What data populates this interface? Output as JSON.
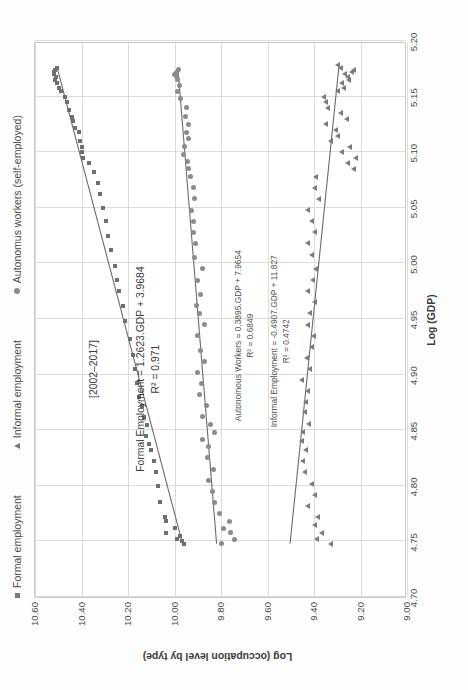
{
  "legend": {
    "items": [
      {
        "label": "Formal employment",
        "marker": "square-marker-icon",
        "color": "#7a7a7a"
      },
      {
        "label": "Informal employment",
        "marker": "triangle-marker-icon",
        "color": "#7a7a7a"
      },
      {
        "label": "Autonomus workers (self-employed)",
        "marker": "circle-marker-icon",
        "color": "#8a8a8a"
      }
    ]
  },
  "period_note": "[2002–2017]",
  "annotations": [
    {
      "equation": "Formal Employment = 1.2623.GDP + 3.9684",
      "r2": "R² = 0.971"
    },
    {
      "equation": "Autonomous Workers = 0.3895.GDP + 7.9654",
      "r2": "R² = 0.6849"
    },
    {
      "equation": "Informal Employment = -0.4907.GDP + 11.827",
      "r2": "R² = 0.4742"
    }
  ],
  "chart_data": {
    "type": "scatter",
    "title": "",
    "xlabel": "Log (GDP)",
    "ylabel": "Log (occupation level by type)",
    "xlim": [
      4.7,
      5.2
    ],
    "ylim": [
      9.0,
      10.6
    ],
    "xticks": [
      "4.70",
      "4.75",
      "4.80",
      "4.85",
      "4.90",
      "4.95",
      "5.00",
      "5.05",
      "5.10",
      "5.15",
      "5.20"
    ],
    "yticks": [
      "9.00",
      "9.20",
      "9.40",
      "9.60",
      "9.80",
      "10.00",
      "10.20",
      "10.40",
      "10.60"
    ],
    "grid": true,
    "legend_position": "top",
    "period": "2002-2017",
    "series": [
      {
        "name": "Formal employment",
        "marker": "square",
        "color": "#6f6f6f",
        "fit": {
          "slope": 1.2623,
          "intercept": 3.9684,
          "r2": 0.971,
          "label": "Formal Employment = 1.2623.GDP + 3.9684"
        },
        "points": [
          [
            4.748,
            9.96
          ],
          [
            4.75,
            9.968
          ],
          [
            4.752,
            9.99
          ],
          [
            4.755,
            9.975
          ],
          [
            4.758,
            10.035
          ],
          [
            4.762,
            10.0
          ],
          [
            4.768,
            10.035
          ],
          [
            4.772,
            10.04
          ],
          [
            4.785,
            10.062
          ],
          [
            4.8,
            10.072
          ],
          [
            4.812,
            10.078
          ],
          [
            4.822,
            10.09
          ],
          [
            4.832,
            10.1
          ],
          [
            4.838,
            10.11
          ],
          [
            4.845,
            10.122
          ],
          [
            4.855,
            10.118
          ],
          [
            4.862,
            10.13
          ],
          [
            4.872,
            10.14
          ],
          [
            4.88,
            10.152
          ],
          [
            4.892,
            10.16
          ],
          [
            4.905,
            10.168
          ],
          [
            4.918,
            10.178
          ],
          [
            4.932,
            10.192
          ],
          [
            4.948,
            10.212
          ],
          [
            4.962,
            10.222
          ],
          [
            4.975,
            10.24
          ],
          [
            4.985,
            10.248
          ],
          [
            4.998,
            10.258
          ],
          [
            5.012,
            10.272
          ],
          [
            5.025,
            10.285
          ],
          [
            5.038,
            10.295
          ],
          [
            5.05,
            10.308
          ],
          [
            5.062,
            10.322
          ],
          [
            5.072,
            10.33
          ],
          [
            5.082,
            10.345
          ],
          [
            5.09,
            10.368
          ],
          [
            5.095,
            10.392
          ],
          [
            5.1,
            10.4
          ],
          [
            5.105,
            10.398
          ],
          [
            5.11,
            10.405
          ],
          [
            5.118,
            10.412
          ],
          [
            5.122,
            10.43
          ],
          [
            5.128,
            10.438
          ],
          [
            5.132,
            10.442
          ],
          [
            5.138,
            10.455
          ],
          [
            5.145,
            10.462
          ],
          [
            5.15,
            10.47
          ],
          [
            5.155,
            10.488
          ],
          [
            5.158,
            10.498
          ],
          [
            5.162,
            10.505
          ],
          [
            5.165,
            10.512
          ],
          [
            5.168,
            10.51
          ],
          [
            5.17,
            10.518
          ],
          [
            5.172,
            10.52
          ],
          [
            5.174,
            10.512
          ],
          [
            5.176,
            10.505
          ]
        ]
      },
      {
        "name": "Autonomus workers (self-employed)",
        "marker": "circle",
        "color": "#8b8b8b",
        "fit": {
          "slope": 0.3895,
          "intercept": 7.9654,
          "r2": 0.6849,
          "label": "Autonomous Workers = 0.3895.GDP + 7.9654"
        },
        "points": [
          [
            4.748,
            9.8
          ],
          [
            4.752,
            9.742
          ],
          [
            4.758,
            9.758
          ],
          [
            4.762,
            9.79
          ],
          [
            4.768,
            9.765
          ],
          [
            4.775,
            9.805
          ],
          [
            4.785,
            9.828
          ],
          [
            4.795,
            9.838
          ],
          [
            4.805,
            9.852
          ],
          [
            4.815,
            9.832
          ],
          [
            4.825,
            9.858
          ],
          [
            4.835,
            9.852
          ],
          [
            4.842,
            9.88
          ],
          [
            4.848,
            9.83
          ],
          [
            4.855,
            9.845
          ],
          [
            4.862,
            9.878
          ],
          [
            4.872,
            9.862
          ],
          [
            4.882,
            9.892
          ],
          [
            4.892,
            9.885
          ],
          [
            4.902,
            9.9
          ],
          [
            4.912,
            9.872
          ],
          [
            4.922,
            9.89
          ],
          [
            4.935,
            9.9
          ],
          [
            4.945,
            9.87
          ],
          [
            4.955,
            9.892
          ],
          [
            4.962,
            9.905
          ],
          [
            4.972,
            9.888
          ],
          [
            4.985,
            9.9
          ],
          [
            4.995,
            9.88
          ],
          [
            5.005,
            9.912
          ],
          [
            5.018,
            9.908
          ],
          [
            5.028,
            9.918
          ],
          [
            5.038,
            9.92
          ],
          [
            5.048,
            9.925
          ],
          [
            5.058,
            9.912
          ],
          [
            5.068,
            9.92
          ],
          [
            5.078,
            9.93
          ],
          [
            5.085,
            9.938
          ],
          [
            5.092,
            9.945
          ],
          [
            5.098,
            9.962
          ],
          [
            5.105,
            9.955
          ],
          [
            5.112,
            9.94
          ],
          [
            5.118,
            9.948
          ],
          [
            5.125,
            9.938
          ],
          [
            5.132,
            9.952
          ],
          [
            5.14,
            9.948
          ],
          [
            5.148,
            9.975
          ],
          [
            5.155,
            9.985
          ],
          [
            5.16,
            9.98
          ],
          [
            5.165,
            9.988
          ],
          [
            5.168,
            9.992
          ],
          [
            5.17,
            9.998
          ],
          [
            5.172,
            9.99
          ],
          [
            5.174,
            9.982
          ]
        ]
      },
      {
        "name": "Informal employment",
        "marker": "triangle",
        "color": "#7b7b7b",
        "fit": {
          "slope": -0.4907,
          "intercept": 11.827,
          "r2": 0.4742,
          "label": "Informal Employment = -0.4907.GDP + 11.827"
        },
        "points": [
          [
            4.748,
            9.33
          ],
          [
            4.752,
            9.39
          ],
          [
            4.758,
            9.368
          ],
          [
            4.765,
            9.4
          ],
          [
            4.772,
            9.385
          ],
          [
            4.782,
            9.43
          ],
          [
            4.792,
            9.398
          ],
          [
            4.802,
            9.412
          ],
          [
            4.812,
            9.442
          ],
          [
            4.822,
            9.448
          ],
          [
            4.832,
            9.438
          ],
          [
            4.84,
            9.455
          ],
          [
            4.848,
            9.448
          ],
          [
            4.856,
            9.425
          ],
          [
            4.866,
            9.442
          ],
          [
            4.875,
            9.438
          ],
          [
            4.885,
            9.428
          ],
          [
            4.895,
            9.452
          ],
          [
            4.905,
            9.42
          ],
          [
            4.915,
            9.432
          ],
          [
            4.925,
            9.412
          ],
          [
            4.935,
            9.402
          ],
          [
            4.945,
            9.43
          ],
          [
            4.955,
            9.418
          ],
          [
            4.965,
            9.4
          ],
          [
            4.975,
            9.43
          ],
          [
            4.985,
            9.408
          ],
          [
            4.995,
            9.395
          ],
          [
            5.008,
            9.412
          ],
          [
            5.018,
            9.43
          ],
          [
            5.028,
            9.398
          ],
          [
            5.038,
            9.412
          ],
          [
            5.048,
            9.43
          ],
          [
            5.058,
            9.382
          ],
          [
            5.068,
            9.4
          ],
          [
            5.078,
            9.392
          ],
          [
            5.085,
            9.232
          ],
          [
            5.09,
            9.258
          ],
          [
            5.095,
            9.222
          ],
          [
            5.1,
            9.28
          ],
          [
            5.105,
            9.248
          ],
          [
            5.11,
            9.33
          ],
          [
            5.115,
            9.3
          ],
          [
            5.12,
            9.308
          ],
          [
            5.125,
            9.352
          ],
          [
            5.13,
            9.262
          ],
          [
            5.135,
            9.288
          ],
          [
            5.14,
            9.34
          ],
          [
            5.145,
            9.352
          ],
          [
            5.15,
            9.36
          ],
          [
            5.155,
            9.298
          ],
          [
            5.158,
            9.272
          ],
          [
            5.162,
            9.28
          ],
          [
            5.165,
            9.25
          ],
          [
            5.168,
            9.258
          ],
          [
            5.17,
            9.268
          ],
          [
            5.172,
            9.24
          ],
          [
            5.174,
            9.23
          ],
          [
            5.176,
            9.288
          ],
          [
            5.178,
            9.3
          ]
        ]
      }
    ]
  }
}
